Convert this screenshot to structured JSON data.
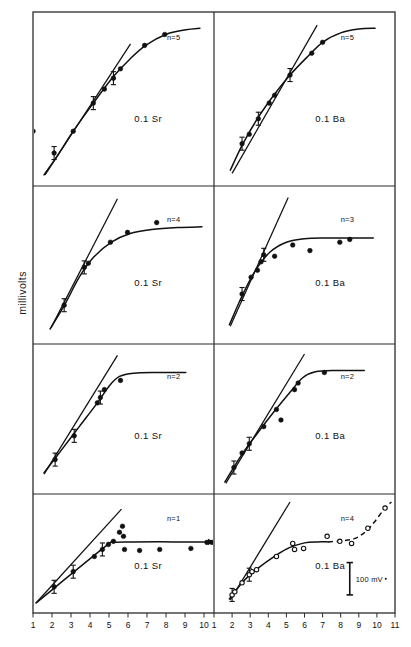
{
  "figure": {
    "ylabel": "millivolts",
    "scalebar_label": "100 mV",
    "grid": {
      "rows": 4,
      "cols": 2
    },
    "frame": {
      "x": 33,
      "y": 12,
      "w": 362,
      "h": 601,
      "divider_x": 214
    },
    "row_dividers": [
      186,
      344,
      494
    ],
    "axis": {
      "left_ticks": [
        "1",
        "2",
        "3",
        "4",
        "5",
        "6",
        "7",
        "8",
        "9",
        "10"
      ],
      "right_ticks": [
        "1",
        "2",
        "3",
        "4",
        "5",
        "6",
        "7",
        "8",
        "9",
        "10",
        "11"
      ],
      "left_range": [
        1,
        10
      ],
      "right_range": [
        1,
        11
      ]
    }
  },
  "chart_data": {
    "type": "scatter",
    "title": "",
    "xlabel": "",
    "ylabel": "millivolts",
    "grid": false,
    "legend_position": "none",
    "annotations": [
      "100 mV scale bar in lower-right panel"
    ],
    "panels": [
      {
        "id": "r1c1",
        "row": 1,
        "col": 1,
        "label": "0.1 Sr",
        "n_label": "n=5",
        "marker": "filled-circle",
        "xlim": [
          1,
          10
        ],
        "ylim": [
          0,
          1
        ],
        "points": [
          {
            "x": 1.0,
            "y": 0.3
          },
          {
            "x": 2.05,
            "y": 0.16
          },
          {
            "x": 3.0,
            "y": 0.3
          },
          {
            "x": 4.0,
            "y": 0.48
          },
          {
            "x": 4.55,
            "y": 0.57
          },
          {
            "x": 5.0,
            "y": 0.64
          },
          {
            "x": 5.35,
            "y": 0.7
          },
          {
            "x": 6.55,
            "y": 0.85
          },
          {
            "x": 7.55,
            "y": 0.92
          }
        ],
        "error_bars": [
          2.05,
          4.0,
          5.0
        ],
        "curve": [
          {
            "x": 1.55,
            "y": 0.02
          },
          {
            "x": 2.2,
            "y": 0.14
          },
          {
            "x": 3.0,
            "y": 0.3
          },
          {
            "x": 4.0,
            "y": 0.48
          },
          {
            "x": 5.0,
            "y": 0.65
          },
          {
            "x": 5.8,
            "y": 0.76
          },
          {
            "x": 6.6,
            "y": 0.85
          },
          {
            "x": 7.6,
            "y": 0.92
          },
          {
            "x": 8.6,
            "y": 0.95
          },
          {
            "x": 9.3,
            "y": 0.96
          }
        ],
        "line": [
          {
            "x": 1.6,
            "y": 0.02
          },
          {
            "x": 5.85,
            "y": 0.86
          }
        ],
        "dashed": false
      },
      {
        "id": "r1c2",
        "row": 1,
        "col": 2,
        "label": "0.1 Ba",
        "n_label": "n=5",
        "marker": "filled-circle",
        "xlim": [
          1,
          11
        ],
        "ylim": [
          0,
          1
        ],
        "points": [
          {
            "x": 2.55,
            "y": 0.22
          },
          {
            "x": 2.95,
            "y": 0.28
          },
          {
            "x": 3.45,
            "y": 0.38
          },
          {
            "x": 4.05,
            "y": 0.48
          },
          {
            "x": 4.35,
            "y": 0.53
          },
          {
            "x": 5.2,
            "y": 0.66
          },
          {
            "x": 6.4,
            "y": 0.8
          },
          {
            "x": 7.0,
            "y": 0.87
          }
        ],
        "error_bars": [
          2.55,
          3.45,
          5.2
        ],
        "curve": [
          {
            "x": 1.9,
            "y": 0.05
          },
          {
            "x": 2.6,
            "y": 0.22
          },
          {
            "x": 3.4,
            "y": 0.38
          },
          {
            "x": 4.3,
            "y": 0.53
          },
          {
            "x": 5.2,
            "y": 0.66
          },
          {
            "x": 6.1,
            "y": 0.77
          },
          {
            "x": 7.0,
            "y": 0.87
          },
          {
            "x": 8.0,
            "y": 0.93
          },
          {
            "x": 9.0,
            "y": 0.955
          },
          {
            "x": 9.9,
            "y": 0.96
          }
        ],
        "line": [
          {
            "x": 2.0,
            "y": 0.03
          },
          {
            "x": 6.7,
            "y": 0.98
          }
        ],
        "dashed": false
      },
      {
        "id": "r2c1",
        "row": 2,
        "col": 1,
        "label": "0.1 Sr",
        "n_label": "n=4",
        "marker": "filled-circle",
        "xlim": [
          1,
          10
        ],
        "ylim": [
          0,
          1
        ],
        "points": [
          {
            "x": 2.55,
            "y": 0.22
          },
          {
            "x": 3.55,
            "y": 0.49
          },
          {
            "x": 3.75,
            "y": 0.52
          },
          {
            "x": 4.85,
            "y": 0.67
          },
          {
            "x": 5.7,
            "y": 0.74
          },
          {
            "x": 7.15,
            "y": 0.81
          }
        ],
        "error_bars": [
          2.55,
          3.6
        ],
        "curve": [
          {
            "x": 1.85,
            "y": 0.05
          },
          {
            "x": 2.6,
            "y": 0.23
          },
          {
            "x": 3.3,
            "y": 0.42
          },
          {
            "x": 4.0,
            "y": 0.56
          },
          {
            "x": 4.9,
            "y": 0.67
          },
          {
            "x": 5.8,
            "y": 0.73
          },
          {
            "x": 6.9,
            "y": 0.76
          },
          {
            "x": 8.2,
            "y": 0.775
          },
          {
            "x": 9.4,
            "y": 0.78
          }
        ],
        "line": [
          {
            "x": 1.9,
            "y": 0.06
          },
          {
            "x": 5.2,
            "y": 0.98
          }
        ],
        "dashed": false
      },
      {
        "id": "r2c2",
        "row": 2,
        "col": 2,
        "label": "0.1 Ba",
        "n_label": "n=3",
        "marker": "filled-circle",
        "xlim": [
          1,
          11
        ],
        "ylim": [
          0,
          1
        ],
        "points": [
          {
            "x": 2.55,
            "y": 0.3
          },
          {
            "x": 3.05,
            "y": 0.42
          },
          {
            "x": 3.4,
            "y": 0.47
          },
          {
            "x": 3.6,
            "y": 0.53
          },
          {
            "x": 3.75,
            "y": 0.58
          },
          {
            "x": 4.35,
            "y": 0.57
          },
          {
            "x": 5.35,
            "y": 0.65
          },
          {
            "x": 6.3,
            "y": 0.61
          },
          {
            "x": 7.95,
            "y": 0.67
          },
          {
            "x": 8.5,
            "y": 0.69
          }
        ],
        "error_bars": [
          2.55,
          3.75
        ],
        "curve": [
          {
            "x": 1.85,
            "y": 0.08
          },
          {
            "x": 2.6,
            "y": 0.3
          },
          {
            "x": 3.3,
            "y": 0.47
          },
          {
            "x": 4.1,
            "y": 0.6
          },
          {
            "x": 5.0,
            "y": 0.67
          },
          {
            "x": 6.0,
            "y": 0.695
          },
          {
            "x": 7.2,
            "y": 0.7
          },
          {
            "x": 8.6,
            "y": 0.7
          },
          {
            "x": 9.8,
            "y": 0.7
          }
        ],
        "line": [
          {
            "x": 1.9,
            "y": 0.07
          },
          {
            "x": 5.1,
            "y": 0.99
          }
        ],
        "dashed": false
      },
      {
        "id": "r3c1",
        "row": 3,
        "col": 1,
        "label": "0.1 Sr",
        "n_label": "n=2",
        "marker": "filled-circle",
        "xlim": [
          1,
          10
        ],
        "ylim": [
          0,
          1
        ],
        "points": [
          {
            "x": 2.1,
            "y": 0.2
          },
          {
            "x": 3.05,
            "y": 0.38
          },
          {
            "x": 4.2,
            "y": 0.63
          },
          {
            "x": 4.35,
            "y": 0.67
          },
          {
            "x": 4.55,
            "y": 0.73
          },
          {
            "x": 5.35,
            "y": 0.8
          }
        ],
        "error_bars": [
          2.1,
          3.05,
          4.3
        ],
        "curve": [
          {
            "x": 1.55,
            "y": 0.1
          },
          {
            "x": 2.4,
            "y": 0.27
          },
          {
            "x": 3.3,
            "y": 0.45
          },
          {
            "x": 4.2,
            "y": 0.63
          },
          {
            "x": 4.8,
            "y": 0.76
          },
          {
            "x": 5.3,
            "y": 0.83
          },
          {
            "x": 6.0,
            "y": 0.855
          },
          {
            "x": 7.2,
            "y": 0.86
          },
          {
            "x": 8.6,
            "y": 0.86
          }
        ],
        "line": [
          {
            "x": 1.55,
            "y": 0.09
          },
          {
            "x": 5.2,
            "y": 0.99
          }
        ],
        "dashed": false
      },
      {
        "id": "r3c2",
        "row": 3,
        "col": 2,
        "label": "0.1 Ba",
        "n_label": "n=2",
        "marker": "filled-circle",
        "xlim": [
          1,
          11
        ],
        "ylim": [
          0,
          1
        ],
        "points": [
          {
            "x": 2.1,
            "y": 0.14
          },
          {
            "x": 2.55,
            "y": 0.25
          },
          {
            "x": 2.95,
            "y": 0.32
          },
          {
            "x": 3.75,
            "y": 0.45
          },
          {
            "x": 4.45,
            "y": 0.58
          },
          {
            "x": 4.7,
            "y": 0.5
          },
          {
            "x": 5.45,
            "y": 0.73
          },
          {
            "x": 5.65,
            "y": 0.78
          },
          {
            "x": 7.1,
            "y": 0.86
          }
        ],
        "error_bars": [
          2.1,
          2.95
        ],
        "curve": [
          {
            "x": 1.6,
            "y": 0.03
          },
          {
            "x": 2.5,
            "y": 0.23
          },
          {
            "x": 3.4,
            "y": 0.4
          },
          {
            "x": 4.3,
            "y": 0.56
          },
          {
            "x": 5.2,
            "y": 0.71
          },
          {
            "x": 5.9,
            "y": 0.82
          },
          {
            "x": 6.6,
            "y": 0.865
          },
          {
            "x": 7.8,
            "y": 0.875
          },
          {
            "x": 9.3,
            "y": 0.875
          }
        ],
        "line": [
          {
            "x": 1.65,
            "y": 0.02
          },
          {
            "x": 6.0,
            "y": 1.0
          }
        ],
        "dashed": false
      },
      {
        "id": "r4c1",
        "row": 4,
        "col": 1,
        "label": "0.1 Sr",
        "n_label": "n=1",
        "marker": "filled-circle",
        "xlim": [
          1,
          10
        ],
        "ylim": [
          0,
          1
        ],
        "points": [
          {
            "x": 2.05,
            "y": 0.18
          },
          {
            "x": 3.0,
            "y": 0.33
          },
          {
            "x": 4.05,
            "y": 0.48
          },
          {
            "x": 4.45,
            "y": 0.55
          },
          {
            "x": 4.75,
            "y": 0.6
          },
          {
            "x": 5.0,
            "y": 0.63
          },
          {
            "x": 5.3,
            "y": 0.72
          },
          {
            "x": 5.45,
            "y": 0.78
          },
          {
            "x": 5.5,
            "y": 0.68
          },
          {
            "x": 5.55,
            "y": 0.55
          },
          {
            "x": 6.3,
            "y": 0.54
          },
          {
            "x": 7.3,
            "y": 0.55
          },
          {
            "x": 8.85,
            "y": 0.56
          },
          {
            "x": 9.65,
            "y": 0.62
          },
          {
            "x": 9.9,
            "y": 0.62
          }
        ],
        "error_bars": [
          2.05,
          3.0,
          4.45
        ],
        "curve": [
          {
            "x": 1.15,
            "y": 0.02
          },
          {
            "x": 4.6,
            "y": 0.58
          },
          {
            "x": 5.0,
            "y": 0.62
          },
          {
            "x": 6.0,
            "y": 0.625
          },
          {
            "x": 8.0,
            "y": 0.625
          },
          {
            "x": 9.95,
            "y": 0.625
          }
        ],
        "line": [
          {
            "x": 1.15,
            "y": 0.02
          },
          {
            "x": 5.4,
            "y": 0.95
          }
        ],
        "arrow_end": true,
        "dashed": false
      },
      {
        "id": "r4c2",
        "row": 4,
        "col": 2,
        "label": "0.1 Ba",
        "n_label": "n=4",
        "marker": "open-circle",
        "xlim": [
          1,
          11
        ],
        "ylim": [
          0,
          1
        ],
        "points": [
          {
            "x": 2.0,
            "y": 0.1
          },
          {
            "x": 2.15,
            "y": 0.13
          },
          {
            "x": 2.55,
            "y": 0.22
          },
          {
            "x": 2.95,
            "y": 0.3
          },
          {
            "x": 3.1,
            "y": 0.33
          },
          {
            "x": 3.35,
            "y": 0.35
          },
          {
            "x": 4.45,
            "y": 0.48
          },
          {
            "x": 5.35,
            "y": 0.61
          },
          {
            "x": 5.45,
            "y": 0.55
          },
          {
            "x": 5.95,
            "y": 0.56
          },
          {
            "x": 7.25,
            "y": 0.68
          },
          {
            "x": 7.95,
            "y": 0.63
          },
          {
            "x": 8.6,
            "y": 0.61
          },
          {
            "x": 9.5,
            "y": 0.76
          },
          {
            "x": 10.45,
            "y": 0.96
          }
        ],
        "error_bars": [
          2.0,
          2.95
        ],
        "curve": [
          {
            "x": 1.85,
            "y": 0.06
          },
          {
            "x": 2.6,
            "y": 0.23
          },
          {
            "x": 3.4,
            "y": 0.36
          },
          {
            "x": 4.4,
            "y": 0.49
          },
          {
            "x": 5.2,
            "y": 0.57
          },
          {
            "x": 6.0,
            "y": 0.615
          },
          {
            "x": 6.7,
            "y": 0.625
          },
          {
            "x": 7.3,
            "y": 0.625
          }
        ],
        "curve_dashed": [
          {
            "x": 7.3,
            "y": 0.625
          },
          {
            "x": 8.1,
            "y": 0.635
          },
          {
            "x": 8.8,
            "y": 0.66
          },
          {
            "x": 9.4,
            "y": 0.73
          },
          {
            "x": 9.9,
            "y": 0.83
          },
          {
            "x": 10.4,
            "y": 0.95
          },
          {
            "x": 10.8,
            "y": 1.02
          }
        ],
        "line": [
          {
            "x": 1.9,
            "y": 0.05
          },
          {
            "x": 5.2,
            "y": 1.02
          }
        ],
        "dashed": true,
        "scalebar": {
          "x": 8.5,
          "y_bottom": 0.1,
          "y_top": 0.42,
          "label": "100 mV"
        }
      }
    ]
  }
}
